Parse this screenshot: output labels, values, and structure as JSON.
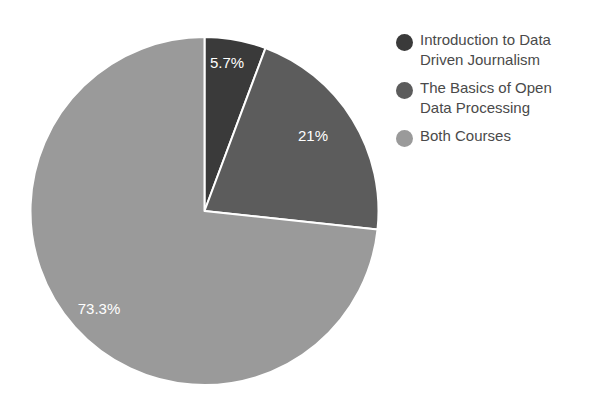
{
  "chart_data": {
    "type": "pie",
    "title": "",
    "subtitle": "",
    "xlabel": "",
    "ylabel": "",
    "grid": false,
    "legend_position": "right",
    "start_angle_deg": 0,
    "direction": "clockwise",
    "background_color": "#ffffff",
    "separator_color": "#ffffff",
    "label_color": "#ffffff",
    "categories": [
      "Introduction to Data Driven Journalism",
      "The Basics of Open Data Processing",
      "Both Courses"
    ],
    "values": [
      5.7,
      21,
      73.3
    ],
    "value_labels": [
      "5.7%",
      "21%",
      "73.3%"
    ],
    "colors": [
      "#3a3a3a",
      "#5c5c5c",
      "#9a9a9a"
    ],
    "slices": [
      {
        "label": "Introduction to Data Driven Journalism",
        "value": 5.7,
        "value_label": "5.7%",
        "color": "#3a3a3a",
        "label_x": 227,
        "label_y": 64
      },
      {
        "label": "The Basics of Open Data Processing",
        "value": 21,
        "value_label": "21%",
        "color": "#5c5c5c",
        "label_x": 313,
        "label_y": 137
      },
      {
        "label": "Both Courses",
        "value": 73.3,
        "value_label": "73.3%",
        "color": "#9a9a9a",
        "label_x": 99,
        "label_y": 310
      }
    ],
    "geometry": {
      "center_x": 204.5,
      "center_y": 211,
      "radius": 174
    }
  },
  "legend": {
    "items": [
      {
        "label": "Introduction to Data\nDriven Journalism",
        "color": "#3a3a3a"
      },
      {
        "label": "The Basics of Open\nData Processing",
        "color": "#5c5c5c"
      },
      {
        "label": "Both Courses",
        "color": "#9a9a9a"
      }
    ]
  }
}
